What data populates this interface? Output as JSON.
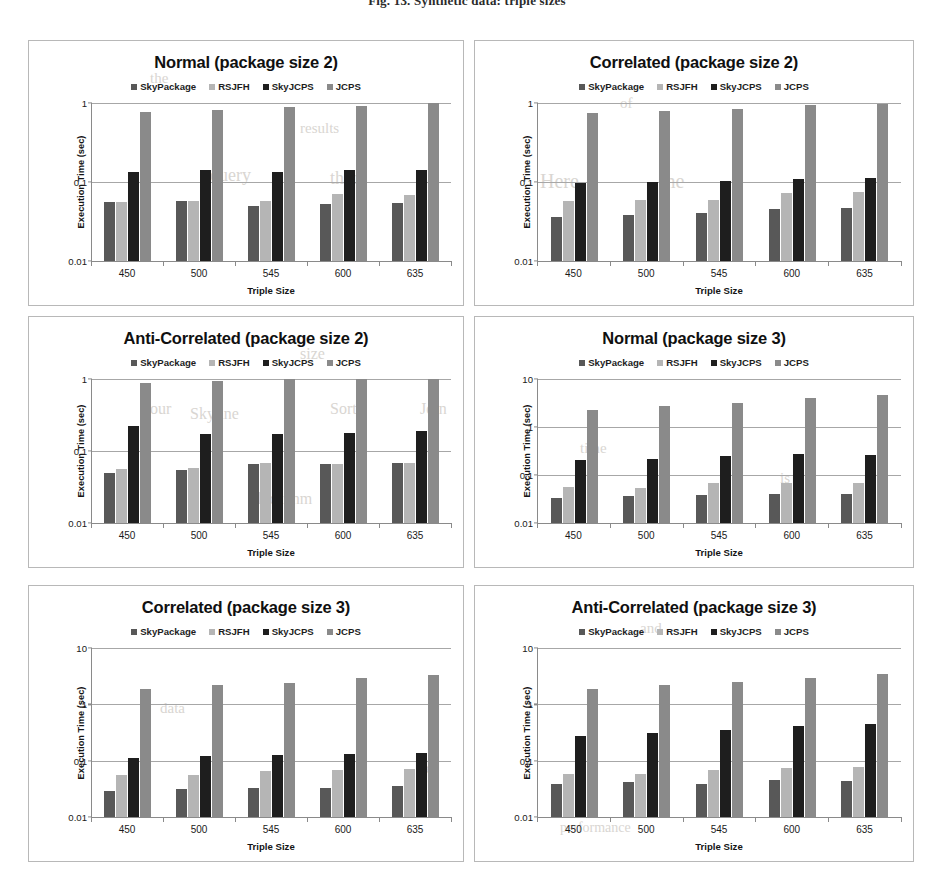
{
  "figure": {
    "caption": "Fig. 13. Synthetic data: triple sizes"
  },
  "ghost_text": [
    {
      "text": "the",
      "x": 150,
      "y": 70,
      "size": 15
    },
    {
      "text": "results",
      "x": 300,
      "y": 120,
      "size": 15
    },
    {
      "text": "of",
      "x": 620,
      "y": 95,
      "size": 15
    },
    {
      "text": "Here",
      "x": 540,
      "y": 170,
      "size": 20
    },
    {
      "text": "the",
      "x": 660,
      "y": 170,
      "size": 20
    },
    {
      "text": "query",
      "x": 210,
      "y": 165,
      "size": 18
    },
    {
      "text": "than",
      "x": 330,
      "y": 168,
      "size": 18
    },
    {
      "text": "size",
      "x": 300,
      "y": 345,
      "size": 16
    },
    {
      "text": "our",
      "x": 150,
      "y": 400,
      "size": 16
    },
    {
      "text": "Skyline",
      "x": 190,
      "y": 405,
      "size": 16
    },
    {
      "text": "Sort",
      "x": 330,
      "y": 400,
      "size": 16
    },
    {
      "text": "Join",
      "x": 420,
      "y": 400,
      "size": 16
    },
    {
      "text": "time",
      "x": 580,
      "y": 440,
      "size": 15
    },
    {
      "text": "is",
      "x": 780,
      "y": 470,
      "size": 15
    },
    {
      "text": "algorithm",
      "x": 250,
      "y": 490,
      "size": 16
    },
    {
      "text": "and",
      "x": 640,
      "y": 620,
      "size": 15
    },
    {
      "text": "data",
      "x": 160,
      "y": 700,
      "size": 15
    },
    {
      "text": "set",
      "x": 420,
      "y": 760,
      "size": 15
    },
    {
      "text": "performance",
      "x": 560,
      "y": 820,
      "size": 14
    }
  ],
  "series_colors": {
    "SkyPackage": "#585858",
    "RSJFH": "#b5b5b5",
    "SkyJCPS": "#1e1e1e",
    "JCPS": "#8a8a8a"
  },
  "legend_labels": [
    "SkyPackage",
    "RSJFH",
    "SkyJCPS",
    "JCPS"
  ],
  "axis": {
    "ylabel": "Execution Time (sec)",
    "xlabel": "Triple Size"
  },
  "chart_data": [
    {
      "type": "bar",
      "title": "Normal (package size 2)",
      "xlabel": "Triple Size",
      "ylabel": "Execution Time (sec)",
      "yscale": "log",
      "ylim": [
        0.01,
        1
      ],
      "yticks": [
        "0.01",
        "0.1",
        "1"
      ],
      "ytick_values": [
        0.01,
        0.1,
        1
      ],
      "grid": true,
      "legend_position": "top",
      "categories": [
        "450",
        "500",
        "545",
        "600",
        "635"
      ],
      "series": [
        {
          "name": "SkyPackage",
          "values": [
            0.056,
            0.058,
            0.05,
            0.052,
            0.054
          ]
        },
        {
          "name": "RSJFH",
          "values": [
            0.056,
            0.057,
            0.057,
            0.07,
            0.069
          ]
        },
        {
          "name": "SkyJCPS",
          "values": [
            0.135,
            0.14,
            0.132,
            0.14,
            0.143
          ]
        },
        {
          "name": "JCPS",
          "values": [
            0.78,
            0.82,
            0.88,
            0.93,
            1.0
          ]
        }
      ]
    },
    {
      "type": "bar",
      "title": "Correlated (package size 2)",
      "xlabel": "Triple Size",
      "ylabel": "Execution Time (sec)",
      "yscale": "log",
      "ylim": [
        0.01,
        1
      ],
      "yticks": [
        "0.01",
        "0.1",
        "1"
      ],
      "ytick_values": [
        0.01,
        0.1,
        1
      ],
      "grid": true,
      "legend_position": "top",
      "categories": [
        "450",
        "500",
        "545",
        "600",
        "635"
      ],
      "series": [
        {
          "name": "SkyPackage",
          "values": [
            0.036,
            0.038,
            0.041,
            0.046,
            0.047
          ]
        },
        {
          "name": "RSJFH",
          "values": [
            0.057,
            0.06,
            0.06,
            0.072,
            0.074
          ]
        },
        {
          "name": "SkyJCPS",
          "values": [
            0.097,
            0.1,
            0.103,
            0.108,
            0.113
          ]
        },
        {
          "name": "JCPS",
          "values": [
            0.74,
            0.79,
            0.84,
            0.94,
            0.98
          ]
        }
      ]
    },
    {
      "type": "bar",
      "title": "Anti-Correlated (package size 2)",
      "xlabel": "Triple Size",
      "ylabel": "Execution Time (sec)",
      "yscale": "log",
      "ylim": [
        0.01,
        1
      ],
      "yticks": [
        "0.01",
        "0.1",
        "1"
      ],
      "ytick_values": [
        0.01,
        0.1,
        1
      ],
      "grid": true,
      "legend_position": "top",
      "categories": [
        "450",
        "500",
        "545",
        "600",
        "635"
      ],
      "series": [
        {
          "name": "SkyPackage",
          "values": [
            0.05,
            0.055,
            0.065,
            0.065,
            0.069
          ]
        },
        {
          "name": "RSJFH",
          "values": [
            0.056,
            0.058,
            0.068,
            0.066,
            0.069
          ]
        },
        {
          "name": "SkyJCPS",
          "values": [
            0.225,
            0.17,
            0.175,
            0.18,
            0.192
          ]
        },
        {
          "name": "JCPS",
          "values": [
            0.87,
            0.93,
            1.0,
            1.0,
            1.0
          ]
        }
      ]
    },
    {
      "type": "bar",
      "title": "Normal (package size 3)",
      "xlabel": "Triple Size",
      "ylabel": "Execution Time (sec)",
      "yscale": "log",
      "ylim": [
        0.01,
        10
      ],
      "yticks": [
        "0.01",
        "0.1",
        "1",
        "10"
      ],
      "ytick_values": [
        0.01,
        0.1,
        1,
        10
      ],
      "grid": true,
      "legend_position": "top",
      "categories": [
        "450",
        "500",
        "545",
        "600",
        "635"
      ],
      "series": [
        {
          "name": "SkyPackage",
          "values": [
            0.033,
            0.037,
            0.038,
            0.041,
            0.041
          ]
        },
        {
          "name": "RSJFH",
          "values": [
            0.057,
            0.054,
            0.068,
            0.067,
            0.068
          ]
        },
        {
          "name": "SkyJCPS",
          "values": [
            0.21,
            0.22,
            0.25,
            0.28,
            0.26
          ]
        },
        {
          "name": "JCPS",
          "values": [
            2.3,
            2.8,
            3.2,
            4.0,
            4.7
          ]
        }
      ]
    },
    {
      "type": "bar",
      "title": "Correlated (package size 3)",
      "xlabel": "Triple Size",
      "ylabel": "Execution Time (sec)",
      "yscale": "log",
      "ylim": [
        0.01,
        10
      ],
      "yticks": [
        "0.01",
        "0.1",
        "1",
        "10"
      ],
      "ytick_values": [
        0.01,
        0.1,
        1,
        10
      ],
      "grid": true,
      "legend_position": "top",
      "categories": [
        "450",
        "500",
        "545",
        "600",
        "635"
      ],
      "series": [
        {
          "name": "SkyPackage",
          "values": [
            0.029,
            0.031,
            0.033,
            0.033,
            0.035
          ]
        },
        {
          "name": "RSJFH",
          "values": [
            0.056,
            0.055,
            0.066,
            0.068,
            0.071
          ]
        },
        {
          "name": "SkyJCPS",
          "values": [
            0.11,
            0.122,
            0.125,
            0.13,
            0.137
          ]
        },
        {
          "name": "JCPS",
          "values": [
            1.9,
            2.2,
            2.4,
            2.9,
            3.3
          ]
        }
      ]
    },
    {
      "type": "bar",
      "title": "Anti-Correlated (package size 3)",
      "xlabel": "Triple Size",
      "ylabel": "Execution Time (sec)",
      "yscale": "log",
      "ylim": [
        0.01,
        10
      ],
      "yticks": [
        "0.01",
        "0.1",
        "1",
        "10"
      ],
      "ytick_values": [
        0.01,
        0.1,
        1,
        10
      ],
      "grid": true,
      "legend_position": "top",
      "categories": [
        "450",
        "500",
        "545",
        "600",
        "635"
      ],
      "series": [
        {
          "name": "SkyPackage",
          "values": [
            0.039,
            0.042,
            0.039,
            0.045,
            0.044
          ]
        },
        {
          "name": "RSJFH",
          "values": [
            0.058,
            0.057,
            0.068,
            0.074,
            0.078
          ]
        },
        {
          "name": "SkyJCPS",
          "values": [
            0.27,
            0.31,
            0.35,
            0.41,
            0.45
          ]
        },
        {
          "name": "JCPS",
          "values": [
            1.9,
            2.2,
            2.5,
            2.9,
            3.4
          ]
        }
      ]
    }
  ],
  "panel_layout": [
    {
      "left": 28,
      "top": 6,
      "width": 436,
      "height": 266
    },
    {
      "left": 474,
      "top": 6,
      "width": 440,
      "height": 266
    },
    {
      "left": 28,
      "top": 282,
      "width": 436,
      "height": 252
    },
    {
      "left": 474,
      "top": 282,
      "width": 440,
      "height": 252
    },
    {
      "left": 28,
      "top": 551,
      "width": 436,
      "height": 277
    },
    {
      "left": 474,
      "top": 551,
      "width": 440,
      "height": 277
    }
  ]
}
